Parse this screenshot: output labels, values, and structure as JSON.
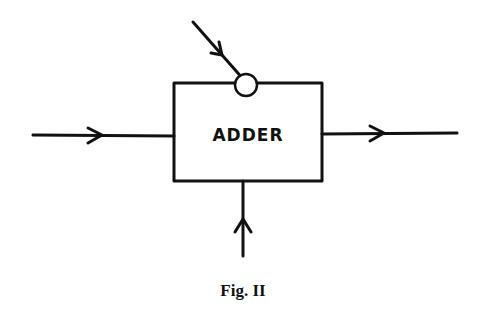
{
  "diagram": {
    "block": {
      "label": "ADDER"
    },
    "inputs": [
      "left-input",
      "top-input",
      "bottom-input"
    ],
    "outputs": [
      "right-output"
    ],
    "caption": "Fig. II"
  },
  "colors": {
    "stroke": "#111111",
    "background": "#ffffff"
  }
}
